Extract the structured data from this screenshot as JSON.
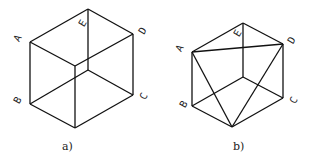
{
  "figures": [
    {
      "caption": "a)",
      "labels": {
        "A": "A",
        "B": "B",
        "C": "C",
        "D": "D",
        "E": "E"
      },
      "description": "Cube wireframe drawn as isometric hexagon with inner edges"
    },
    {
      "caption": "b)",
      "labels": {
        "A": "A",
        "B": "B",
        "C": "C",
        "D": "D",
        "E": "E"
      },
      "description": "Same cube with diagonals A-D, A-bottom, D-bottom forming a triangle"
    }
  ]
}
